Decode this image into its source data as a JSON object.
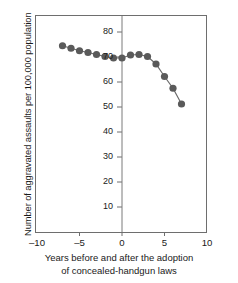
{
  "chart_data": {
    "type": "line",
    "title": "",
    "xlabel": "Years before and after the adoption of concealed-handgun laws",
    "xlabel_line1": "Years before and after the adoption",
    "xlabel_line2": "of concealed-handgun laws",
    "ylabel": "Number of aggravated assaults per 100,000 population",
    "xlim": [
      -10,
      10
    ],
    "ylim": [
      0,
      85
    ],
    "grid": false,
    "legend": null,
    "marker": "filled-circle",
    "marker_color": "#5a5a5a",
    "line_color": "#6b6b6b",
    "axis_color": "#6e6e6e",
    "zero_reference_line": 0,
    "xticks": [
      -10,
      -5,
      0,
      5,
      10
    ],
    "xtick_labels": [
      "–10",
      "–5",
      "0",
      "5",
      "10"
    ],
    "yticks": [
      10,
      20,
      30,
      40,
      50,
      60,
      70,
      80
    ],
    "ytick_labels": [
      "10",
      "20",
      "30",
      "40",
      "50",
      "60",
      "70",
      "80"
    ],
    "x": [
      -7,
      -6,
      -5,
      -4,
      -3,
      -2,
      -1,
      0,
      1,
      2,
      3,
      4,
      5,
      6,
      7
    ],
    "values": [
      74.5,
      73.5,
      72.5,
      71.8,
      71.0,
      70.2,
      69.6,
      69.6,
      70.8,
      71.0,
      70.2,
      67.2,
      62.2,
      57.5,
      51.2
    ],
    "series": [
      {
        "name": "Aggravated assaults",
        "x": [
          -7,
          -6,
          -5,
          -4,
          -3,
          -2,
          -1,
          0,
          1,
          2,
          3,
          4,
          5,
          6,
          7
        ],
        "values": [
          74.5,
          73.5,
          72.5,
          71.8,
          71.0,
          70.2,
          69.6,
          69.6,
          70.8,
          71.0,
          70.2,
          67.2,
          62.2,
          57.5,
          51.2
        ]
      }
    ]
  }
}
